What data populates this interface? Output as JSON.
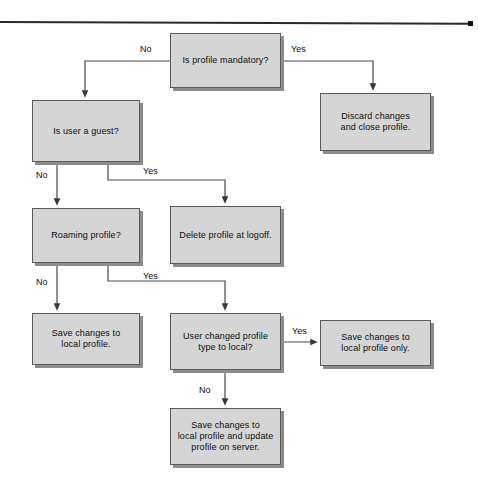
{
  "diagram": {
    "colors": {
      "node_fill": "#d5d5d5",
      "node_border": "#5a5a5a",
      "shadow": "#8c8c8c",
      "text": "#0d0d0d",
      "rule": "#2a2a2a"
    },
    "nodes": [
      {
        "id": "is_profile_mandatory",
        "label": "Is profile mandatory?",
        "x": 170,
        "y": 33,
        "w": 111,
        "h": 55,
        "type": "decision"
      },
      {
        "id": "discard_changes",
        "label": "Discard changes\nand close profile.",
        "x": 320,
        "y": 93,
        "w": 111,
        "h": 58,
        "type": "process"
      },
      {
        "id": "is_user_guest",
        "label": "Is user a guest?",
        "x": 32,
        "y": 100,
        "w": 108,
        "h": 62,
        "type": "decision"
      },
      {
        "id": "roaming_profile",
        "label": "Roaming profile?",
        "x": 32,
        "y": 208,
        "w": 108,
        "h": 55,
        "type": "decision"
      },
      {
        "id": "delete_profile_logoff",
        "label": "Delete profile at logoff.",
        "x": 170,
        "y": 206,
        "w": 111,
        "h": 58,
        "type": "process"
      },
      {
        "id": "save_local_profile",
        "label": "Save changes to\nlocal profile.",
        "x": 32,
        "y": 313,
        "w": 108,
        "h": 52,
        "type": "process"
      },
      {
        "id": "user_changed_type",
        "label": "User changed profile\ntype to local?",
        "x": 170,
        "y": 313,
        "w": 111,
        "h": 57,
        "type": "decision"
      },
      {
        "id": "save_local_only",
        "label": "Save changes to\nlocal profile only.",
        "x": 320,
        "y": 320,
        "w": 111,
        "h": 46,
        "type": "process"
      },
      {
        "id": "save_local_and_server",
        "label": "Save changes to\nlocal profile and update\nprofile on server.",
        "x": 170,
        "y": 408,
        "w": 111,
        "h": 57,
        "type": "process"
      }
    ],
    "edge_labels": [
      {
        "id": "mandatory-no",
        "text": "No",
        "x": 140,
        "y": 44
      },
      {
        "id": "mandatory-yes",
        "text": "Yes",
        "x": 291,
        "y": 44
      },
      {
        "id": "guest-no",
        "text": "No",
        "x": 36,
        "y": 170
      },
      {
        "id": "guest-yes",
        "text": "Yes",
        "x": 143,
        "y": 166
      },
      {
        "id": "roaming-no",
        "text": "No",
        "x": 36,
        "y": 277
      },
      {
        "id": "roaming-yes",
        "text": "Yes",
        "x": 143,
        "y": 271
      },
      {
        "id": "changed-yes",
        "text": "Yes",
        "x": 292,
        "y": 326
      },
      {
        "id": "changed-no",
        "text": "No",
        "x": 199,
        "y": 385
      }
    ],
    "edges": [
      {
        "id": "mandatory-to-guest",
        "from": "is_profile_mandatory",
        "to": "is_user_guest",
        "label": "No"
      },
      {
        "id": "mandatory-to-discard",
        "from": "is_profile_mandatory",
        "to": "discard_changes",
        "label": "Yes"
      },
      {
        "id": "guest-to-roaming",
        "from": "is_user_guest",
        "to": "roaming_profile",
        "label": "No"
      },
      {
        "id": "guest-to-delete",
        "from": "is_user_guest",
        "to": "delete_profile_logoff",
        "label": "Yes"
      },
      {
        "id": "roaming-to-save-local",
        "from": "roaming_profile",
        "to": "save_local_profile",
        "label": "No"
      },
      {
        "id": "roaming-to-changed-type",
        "from": "roaming_profile",
        "to": "user_changed_type",
        "label": "Yes"
      },
      {
        "id": "changed-to-save-local-only",
        "from": "user_changed_type",
        "to": "save_local_only",
        "label": "Yes"
      },
      {
        "id": "changed-to-save-server",
        "from": "user_changed_type",
        "to": "save_local_and_server",
        "label": "No"
      }
    ]
  }
}
